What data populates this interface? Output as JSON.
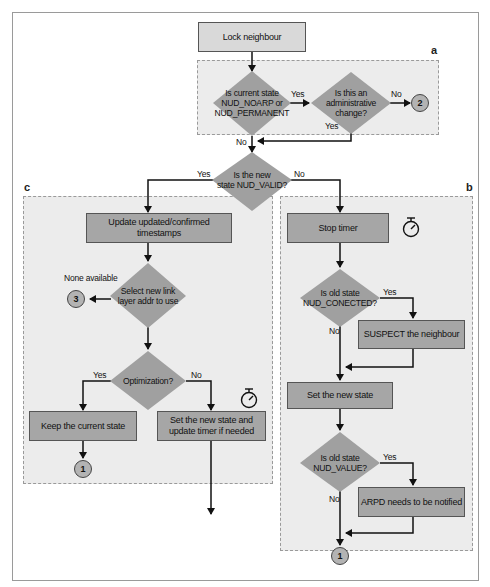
{
  "regions": {
    "a": {
      "label": "a"
    },
    "b": {
      "label": "b"
    },
    "c": {
      "label": "c"
    }
  },
  "nodes": {
    "lock_neighbour": "Lock neighbour",
    "is_noarp_line1": "Is current state",
    "is_noarp_line2": "NUD_NOARP or",
    "is_noarp_line3": "NUD_PERMANENT",
    "is_admin_line1": "Is this an",
    "is_admin_line2": "administrative",
    "is_admin_line3": "change?",
    "is_valid_line1": "Is the new",
    "is_valid_line2": "state NUD_VALID?",
    "update_ts_line1": "Update updated/confirmed",
    "update_ts_line2": "timestamps",
    "stop_timer": "Stop timer",
    "select_addr_line1": "Select new link",
    "select_addr_line2": "layer addr to use",
    "optimization": "Optimization?",
    "keep_state": "Keep the current state",
    "set_state_timer_line1": "Set the new state and",
    "set_state_timer_line2": "update timer if needed",
    "is_connected_line1": "Is old state",
    "is_connected_line2": "NUD_CONECTED?",
    "suspect": "SUSPECT the neighbour",
    "set_new_state": "Set the new state",
    "is_value_line1": "Is old state",
    "is_value_line2": "NUD_VALUE?",
    "arpd": "ARPD needs to be notified"
  },
  "connectors": {
    "c2": "2",
    "c3": "3",
    "c1_left": "1",
    "c1_right": "1"
  },
  "edge_labels": {
    "noarp_yes": "Yes",
    "admin_no": "No",
    "admin_yes": "Yes",
    "noarp_no": "No",
    "valid_yes": "Yes",
    "valid_no": "No",
    "none_available": "None available",
    "opt_yes": "Yes",
    "opt_no": "No",
    "conn_yes": "Yes",
    "conn_no": "No",
    "value_yes": "Yes",
    "value_no": "No"
  },
  "icons": {
    "timer_b": "stopwatch-icon",
    "timer_c": "stopwatch-icon"
  },
  "colors": {
    "process_fill": "#a6a6a6",
    "start_fill": "#d9d9d9",
    "diamond_fill": "#a0a0a0",
    "region_fill": "#ececec"
  }
}
